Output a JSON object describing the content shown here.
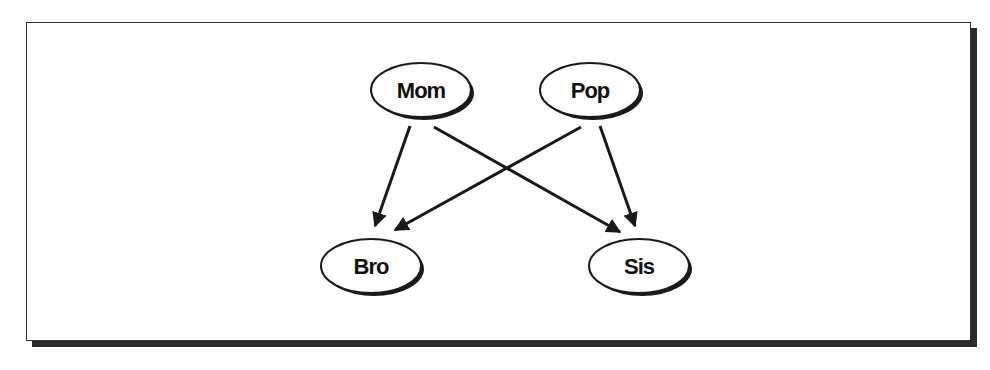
{
  "diagram": {
    "nodes": [
      {
        "id": "mom",
        "label": "Mom",
        "cx": 421,
        "cy": 90
      },
      {
        "id": "pop",
        "label": "Pop",
        "cx": 590,
        "cy": 90
      },
      {
        "id": "bro",
        "label": "Bro",
        "cx": 371,
        "cy": 266
      },
      {
        "id": "sis",
        "label": "Sis",
        "cx": 639,
        "cy": 266
      }
    ],
    "edges": [
      {
        "from": "Mom",
        "to": "Bro"
      },
      {
        "from": "Mom",
        "to": "Sis"
      },
      {
        "from": "Pop",
        "to": "Bro"
      },
      {
        "from": "Pop",
        "to": "Sis"
      }
    ]
  }
}
